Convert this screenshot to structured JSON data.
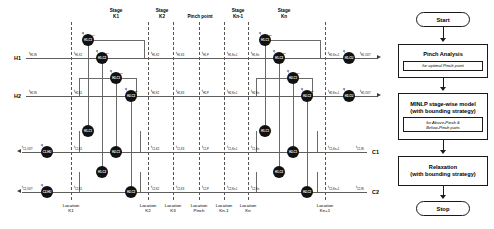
{
  "diagram": {
    "stage_headers": [
      {
        "id": "stage-k1",
        "line1": "Stage",
        "line2": "K1",
        "x": 116,
        "y": 8
      },
      {
        "id": "stage-k2",
        "line1": "Stage",
        "line2": "K2",
        "x": 162,
        "y": 8
      },
      {
        "id": "pinch-point",
        "line1": "Pinch point",
        "line2": "",
        "x": 199,
        "y": 11
      },
      {
        "id": "stage-kn1",
        "line1": "Stage",
        "line2": "Kn-1",
        "x": 238,
        "y": 8
      },
      {
        "id": "stage-kn",
        "line1": "Stage",
        "line2": "Kn",
        "x": 284,
        "y": 8
      }
    ],
    "location_lines": [
      {
        "id": "loc-k1",
        "line1": "Location",
        "line2": "K1",
        "x": 71
      },
      {
        "id": "loc-k2",
        "line1": "Location",
        "line2": "K2",
        "x": 148
      },
      {
        "id": "loc-k3",
        "line1": "Location",
        "line2": "K3",
        "x": 173
      },
      {
        "id": "loc-pinch",
        "line1": "Location",
        "line2": "Pinch",
        "x": 199
      },
      {
        "id": "loc-kn1",
        "line1": "Location",
        "line2": "Kn-1",
        "x": 224
      },
      {
        "id": "loc-kn",
        "line1": "Location",
        "line2": "Kn",
        "x": 248
      },
      {
        "id": "loc-kn1p",
        "line1": "Location",
        "line2": "Kn+1",
        "x": 325
      }
    ],
    "streams": [
      {
        "id": "h1",
        "label": "H1",
        "y": 58,
        "type": "hot",
        "inlet": "t",
        "inlet_sub": "H1,IN",
        "outlet": "t",
        "outlet_sub": "H1,OUT"
      },
      {
        "id": "h2",
        "label": "H2",
        "y": 96,
        "type": "hot",
        "inlet": "t",
        "inlet_sub": "H2,IN",
        "outlet": "t",
        "outlet_sub": "H2,OUT"
      },
      {
        "id": "c1",
        "label": "C1",
        "y": 152,
        "type": "cold",
        "inlet": "t",
        "inlet_sub": "C1,IN",
        "outlet": "t",
        "outlet_sub": "C1,OUT"
      },
      {
        "id": "c2",
        "label": "C2",
        "y": 192,
        "type": "cold",
        "inlet": "t",
        "inlet_sub": "C2,IN",
        "outlet": "t",
        "outlet_sub": "C2,OUT"
      }
    ],
    "temperature_tags": [
      {
        "stream": "h1",
        "sub": "H1,K1"
      },
      {
        "stream": "h1",
        "sub": "H1,K2"
      },
      {
        "stream": "h1",
        "sub": "H1,K3"
      },
      {
        "stream": "h1",
        "sub": "H1,P"
      },
      {
        "stream": "h1",
        "sub": "H1,Kn-1"
      },
      {
        "stream": "h1",
        "sub": "H1,Kn"
      },
      {
        "stream": "h1",
        "sub": "H1,Kn+1"
      },
      {
        "stream": "h2",
        "sub": "H2,K1"
      },
      {
        "stream": "h2",
        "sub": "H2,K2"
      },
      {
        "stream": "h2",
        "sub": "H2,K3"
      },
      {
        "stream": "h2",
        "sub": "H2,P"
      },
      {
        "stream": "h2",
        "sub": "H2,Kn-1"
      },
      {
        "stream": "h2",
        "sub": "H2,Kn"
      },
      {
        "stream": "h2",
        "sub": "H2,Kn+1"
      },
      {
        "stream": "c1",
        "sub": "C1,K1"
      },
      {
        "stream": "c1",
        "sub": "C1,K2"
      },
      {
        "stream": "c1",
        "sub": "C1,K3"
      },
      {
        "stream": "c1",
        "sub": "C1,P"
      },
      {
        "stream": "c1",
        "sub": "C1,Kn-1"
      },
      {
        "stream": "c1",
        "sub": "C1,Kn"
      },
      {
        "stream": "c1",
        "sub": "C1,Kn+1"
      },
      {
        "stream": "c2",
        "sub": "C2,K1"
      },
      {
        "stream": "c2",
        "sub": "C2,K2"
      },
      {
        "stream": "c2",
        "sub": "C2,K3"
      },
      {
        "stream": "c2",
        "sub": "C2,P"
      },
      {
        "stream": "c2",
        "sub": "C2,Kn-1"
      },
      {
        "stream": "c2",
        "sub": "C2,Kn"
      },
      {
        "stream": "c2",
        "sub": "C2,Kn+1"
      }
    ],
    "exchangers": [
      {
        "id": "ex-h1c1k1-a",
        "node": "H1,C1",
        "q": "q",
        "q_sub": "H1,C1,K1",
        "x": 88,
        "y": 40
      },
      {
        "id": "ex-h1c2k1",
        "node": "H1,C2",
        "q": "q",
        "q_sub": "H1,C2,K1",
        "x": 102,
        "y": 58
      },
      {
        "id": "ex-h2c1k1",
        "node": "H2,C1",
        "q": "q",
        "q_sub": "H2,C1,K1",
        "x": 116,
        "y": 78
      },
      {
        "id": "ex-h2c2k1",
        "node": "H2,C2",
        "q": "q",
        "q_sub": "H2,C2,K1",
        "x": 131,
        "y": 96
      },
      {
        "id": "ex-c1-k1",
        "node": "H1,C1",
        "q": "",
        "q_sub": "",
        "x": 88,
        "y": 131
      },
      {
        "id": "ex-c1-k1b",
        "node": "H2,C1",
        "q": "",
        "q_sub": "",
        "x": 116,
        "y": 152
      },
      {
        "id": "ex-c2-k1",
        "node": "H1,C2",
        "q": "",
        "q_sub": "",
        "x": 102,
        "y": 172
      },
      {
        "id": "ex-c2-k1b",
        "node": "H2,C2",
        "q": "",
        "q_sub": "",
        "x": 131,
        "y": 192
      },
      {
        "id": "ex-h1c1kn",
        "node": "H1,C1",
        "q": "q",
        "q_sub": "H1,C1,Kn",
        "x": 265,
        "y": 40
      },
      {
        "id": "ex-h1c2kn",
        "node": "H1,C2",
        "q": "q",
        "q_sub": "H1,C2,Kn",
        "x": 279,
        "y": 58
      },
      {
        "id": "ex-h2c1kn",
        "node": "H2,C1",
        "q": "q",
        "q_sub": "H2,C1,Kn",
        "x": 293,
        "y": 78
      },
      {
        "id": "ex-h2c2kn",
        "node": "H2,C2",
        "q": "q",
        "q_sub": "H2,C2,Kn",
        "x": 307,
        "y": 96
      },
      {
        "id": "ex-c1-kn",
        "node": "H1,C1",
        "q": "",
        "q_sub": "",
        "x": 265,
        "y": 131
      },
      {
        "id": "ex-c1-knb",
        "node": "H2,C1",
        "q": "",
        "q_sub": "",
        "x": 293,
        "y": 152
      },
      {
        "id": "ex-c2-kn",
        "node": "H1,C2",
        "q": "",
        "q_sub": "",
        "x": 279,
        "y": 172
      },
      {
        "id": "ex-c2-knb",
        "node": "H2,C2",
        "q": "",
        "q_sub": "",
        "x": 307,
        "y": 192
      }
    ],
    "utility_units": [
      {
        "id": "util-h1",
        "node": "H1,CU",
        "q": "q",
        "q_sub": "H1,CU",
        "x": 349,
        "y": 58
      },
      {
        "id": "util-h2",
        "node": "H2,CU",
        "q": "q",
        "q_sub": "H2,CU",
        "x": 349,
        "y": 96
      },
      {
        "id": "util-c1",
        "node": "C1,HU",
        "q": "q",
        "q_sub": "C1,HU",
        "x": 40,
        "y": 152
      },
      {
        "id": "util-c2",
        "node": "C2,HU",
        "q": "q",
        "q_sub": "C2,HU",
        "x": 40,
        "y": 192
      }
    ]
  },
  "flowchart": {
    "start": "Start",
    "stop": "Stop",
    "steps": [
      {
        "id": "step-pinch-analysis",
        "title": "Pinch Analysis",
        "sub": "for optimal Pinch point"
      },
      {
        "id": "step-minlp",
        "title": "MINLP stage-wise model\n(with bounding strategy)",
        "title_l1": "MINLP stage-wise model",
        "title_l2": "(with bounding strategy)",
        "sub": "for Above-Pinch &\nBelow-Pinch parts",
        "sub_l1": "for Above-Pinch &",
        "sub_l2": "Below-Pinch parts"
      },
      {
        "id": "step-relaxation",
        "title_l1": "Relaxation",
        "title_l2": "(with bounding strategy)",
        "sub": ""
      }
    ]
  },
  "colors": {
    "stream": "#5d5d5d",
    "node": "#111111",
    "dash": "#555555",
    "box": "#1a1a1a",
    "background": "#ffffff"
  }
}
